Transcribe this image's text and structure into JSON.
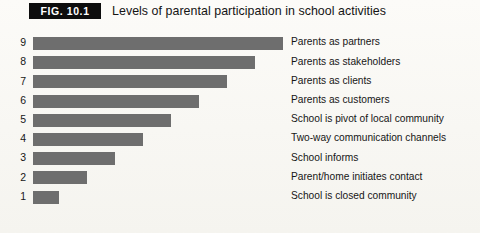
{
  "figure": {
    "tag": "FIG. 10.1",
    "title": "Levels of parental participation in school activities"
  },
  "colors": {
    "bar": "#6e6e6e",
    "tag_background": "#0d0d0d",
    "tag_text": "#ffffff",
    "page_background": "#fbfaf7",
    "text": "#161616"
  },
  "chart_data": {
    "type": "bar",
    "orientation": "horizontal",
    "title": "Levels of parental participation in school activities",
    "xlabel": "",
    "ylabel": "",
    "grid": false,
    "legend": false,
    "axis_visible": false,
    "categories": [
      "9",
      "8",
      "7",
      "6",
      "5",
      "4",
      "3",
      "2",
      "1"
    ],
    "values": [
      9,
      8,
      7,
      6,
      5,
      4,
      3,
      2,
      1
    ],
    "ylim": [
      0,
      9
    ],
    "tick_labels": [
      "9",
      "8",
      "7",
      "6",
      "5",
      "4",
      "3",
      "2",
      "1"
    ],
    "annotations": [
      "Parents as partners",
      "Parents as stakeholders",
      "Parents as clients",
      "Parents as customers",
      "School is pivot of local community",
      "Two-way communication channels",
      "School informs",
      "Parent/home initiates contact",
      "School is closed community"
    ],
    "bars": [
      {
        "rank": "9",
        "value": 9,
        "label": "Parents as partners"
      },
      {
        "rank": "8",
        "value": 8,
        "label": "Parents as stakeholders"
      },
      {
        "rank": "7",
        "value": 7,
        "label": "Parents as clients"
      },
      {
        "rank": "6",
        "value": 6,
        "label": "Parents as customers"
      },
      {
        "rank": "5",
        "value": 5,
        "label": "School is pivot of local community"
      },
      {
        "rank": "4",
        "value": 4,
        "label": "Two-way communication channels"
      },
      {
        "rank": "3",
        "value": 3,
        "label": "School informs"
      },
      {
        "rank": "2",
        "value": 2,
        "label": "Parent/home initiates contact"
      },
      {
        "rank": "1",
        "value": 1,
        "label": "School is closed community"
      }
    ]
  }
}
